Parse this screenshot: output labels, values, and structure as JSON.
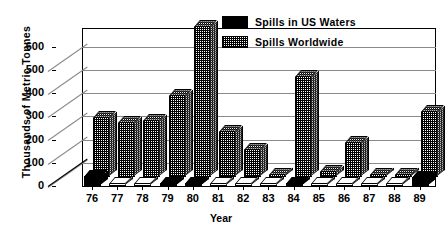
{
  "chart_data": {
    "type": "bar",
    "title": "",
    "xlabel": "Year",
    "ylabel": "Thousands of Metric Tonnes",
    "categories": [
      "76",
      "77",
      "78",
      "79",
      "80",
      "81",
      "82",
      "83",
      "84",
      "85",
      "86",
      "87",
      "88",
      "89"
    ],
    "yticks": [
      0,
      100,
      200,
      300,
      400,
      500,
      600
    ],
    "ylim": [
      0,
      680
    ],
    "grid": true,
    "legend_position": "top-right",
    "series": [
      {
        "name": "Spills in US Waters",
        "color": "#000000",
        "values": [
          42,
          6,
          6,
          12,
          10,
          6,
          5,
          5,
          14,
          6,
          5,
          5,
          5,
          38
        ]
      },
      {
        "name": "Spills Worldwide",
        "color": "#cccccc",
        "values": [
          257,
          235,
          245,
          355,
          650,
          200,
          120,
          12,
          435,
          25,
          150,
          8,
          10,
          285
        ]
      }
    ]
  },
  "axis": {
    "y_title": "Thousands of Metric Tonnes",
    "x_title": "Year",
    "y_labels": [
      "600",
      "500",
      "400",
      "300",
      "200",
      "100",
      "0"
    ],
    "x_labels": [
      "76",
      "77",
      "78",
      "79",
      "80",
      "81",
      "82",
      "83",
      "84",
      "85",
      "86",
      "87",
      "88",
      "89"
    ]
  },
  "legend": {
    "items": [
      {
        "label": "Spills in US Waters",
        "swatch": "black"
      },
      {
        "label": "Spills Worldwide",
        "swatch": "hatch"
      }
    ]
  }
}
